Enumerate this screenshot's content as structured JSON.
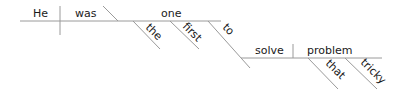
{
  "diagram": {
    "type": "sentence-diagram",
    "sentence": "He was the first one to solve that tricky problem",
    "line_color": "#9a9a9a",
    "text_color": "#1a1a1a",
    "words": {
      "subject": "He",
      "verb": "was",
      "complement": "one",
      "modifier_1": "the",
      "modifier_2": "first",
      "infinitive_marker": "to",
      "infinitive_verb": "solve",
      "object": "problem",
      "object_modifier_1": "that",
      "object_modifier_2": "tricky"
    }
  }
}
